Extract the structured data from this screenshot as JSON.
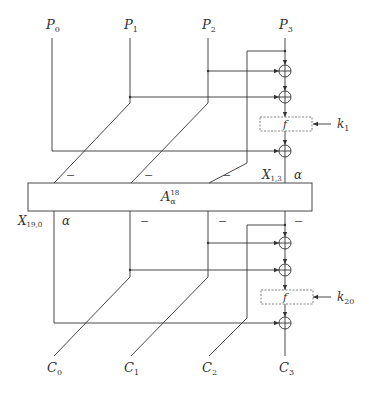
{
  "diagram": {
    "inputs": [
      {
        "base": "P",
        "sub": "0"
      },
      {
        "base": "P",
        "sub": "1"
      },
      {
        "base": "P",
        "sub": "2"
      },
      {
        "base": "P",
        "sub": "3"
      }
    ],
    "outputs": [
      {
        "base": "C",
        "sub": "0"
      },
      {
        "base": "C",
        "sub": "1"
      },
      {
        "base": "C",
        "sub": "2"
      },
      {
        "base": "C",
        "sub": "3"
      }
    ],
    "top_round": {
      "function": "f",
      "key": {
        "base": "k",
        "sub": "1"
      }
    },
    "bottom_round": {
      "function": "f",
      "key": {
        "base": "k",
        "sub": "20"
      }
    },
    "middle_block": {
      "base": "A",
      "sub": "α",
      "sup": "18"
    },
    "top_block_labels": {
      "minus_marks": [
        "−",
        "−",
        "−"
      ],
      "x_label": {
        "base": "X",
        "sub": "1,3"
      },
      "alpha": "α"
    },
    "bottom_block_labels": {
      "x_label": {
        "base": "X",
        "sub": "19,0"
      },
      "alpha": "α",
      "minus_marks": [
        "−",
        "−",
        "−"
      ]
    },
    "colors": {
      "line": "#333333",
      "dashed_box": "#777777"
    }
  }
}
